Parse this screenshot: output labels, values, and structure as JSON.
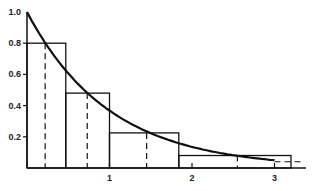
{
  "chart_data": {
    "type": "line",
    "title": "",
    "xlabel": "",
    "ylabel": "",
    "xlim": [
      0,
      3.35
    ],
    "ylim": [
      0,
      1.0
    ],
    "grid": false,
    "legend": null,
    "x_ticks": [
      1,
      2,
      3
    ],
    "x_tick_labels": [
      "1",
      "2",
      "3"
    ],
    "y_ticks": [
      0.2,
      0.4,
      0.6,
      0.8,
      1.0
    ],
    "y_tick_labels": [
      "0.2",
      "0.4",
      "0.6",
      "0.8",
      "1.0"
    ],
    "series": [
      {
        "name": "exponential curve",
        "kind": "curve",
        "function": "exp(-x)",
        "x": [
          0,
          0.25,
          0.5,
          0.75,
          1.0,
          1.25,
          1.5,
          1.75,
          2.0,
          2.25,
          2.5,
          2.75,
          3.0,
          3.2
        ],
        "y": [
          1.0,
          0.78,
          0.61,
          0.47,
          0.37,
          0.29,
          0.22,
          0.17,
          0.14,
          0.11,
          0.08,
          0.06,
          0.05,
          0.04
        ]
      },
      {
        "name": "step rectangles",
        "kind": "bars",
        "bins": [
          {
            "x0": 0.0,
            "x1": 0.47,
            "height": 0.8
          },
          {
            "x0": 0.47,
            "x1": 1.0,
            "height": 0.48
          },
          {
            "x0": 1.0,
            "x1": 1.84,
            "height": 0.225
          },
          {
            "x0": 1.84,
            "x1": 3.2,
            "height": 0.08
          }
        ]
      },
      {
        "name": "dashed verticals",
        "kind": "dashed",
        "x": [
          0.22,
          0.73,
          1.45,
          2.55
        ],
        "heights": [
          0.8,
          0.48,
          0.225,
          0.08
        ]
      },
      {
        "name": "dashed tail",
        "kind": "dashed-horizontal",
        "x0": 3.0,
        "x1": 3.35,
        "y": 0.04
      }
    ]
  }
}
